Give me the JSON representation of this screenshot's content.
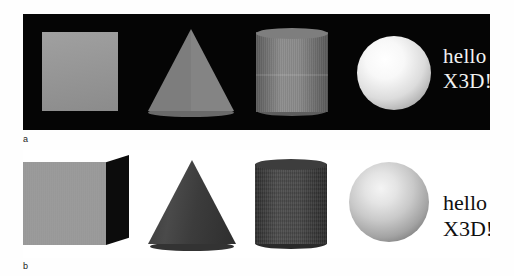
{
  "figure": {
    "panels": [
      {
        "id": "a",
        "caption": "a",
        "background_color": "#050505",
        "text_color": "#f2f2f2",
        "overlay_text": {
          "line1": "hello",
          "line2": "X3D!"
        },
        "shapes": [
          {
            "name": "box",
            "label": "Box",
            "fill": "#9b9b9b"
          },
          {
            "name": "cone",
            "label": "Cone",
            "fill": "#7d7d7d"
          },
          {
            "name": "cylinder",
            "label": "Cylinder",
            "fill": "#8a8a8a"
          },
          {
            "name": "sphere",
            "label": "Sphere",
            "fill": "#f8f8f8"
          }
        ]
      },
      {
        "id": "b",
        "caption": "b",
        "background_color": "#ffffff",
        "text_color": "#101010",
        "overlay_text": {
          "line1": "hello",
          "line2": "X3D!"
        },
        "shapes": [
          {
            "name": "box",
            "label": "Box",
            "fill": "#9a9a9a"
          },
          {
            "name": "cone",
            "label": "Cone",
            "fill": "#3c3c3c"
          },
          {
            "name": "cylinder",
            "label": "Cylinder",
            "fill": "#474747"
          },
          {
            "name": "sphere",
            "label": "Sphere",
            "fill": "#c9c9c9"
          }
        ]
      }
    ]
  }
}
